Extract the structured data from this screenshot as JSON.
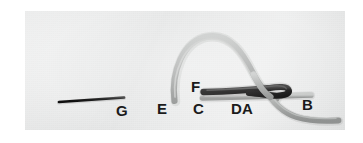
{
  "figure": {
    "kind": "photograph",
    "background_color": "#e9eaea",
    "page_background": "#ffffff",
    "photo_bounds": {
      "x": 25,
      "y": 11,
      "width": 320,
      "height": 119
    }
  },
  "colors": {
    "thread_gray": "#a6a8a7",
    "thread_gray_shadow": "#8c8e8d",
    "thread_gray_highlight": "#c9cbca",
    "thread_black": "#151515",
    "label_text": "#1b1b1b",
    "photo_background": "#e9eaea"
  },
  "labels": [
    {
      "id": "G",
      "text": "G",
      "x": 91,
      "y": 99,
      "describes": "thin straight black suture strand, detached, at far left"
    },
    {
      "id": "E",
      "text": "E",
      "x": 158,
      "y": 97,
      "describes": "free lower end of the large gray suture loop"
    },
    {
      "id": "F",
      "text": "F",
      "x": 191,
      "y": 77,
      "describes": "left end of the black suture strand"
    },
    {
      "id": "C",
      "text": "C",
      "x": 193,
      "y": 97,
      "describes": "left end of the lower gray suture strand"
    },
    {
      "id": "DA",
      "text": "DA",
      "x": 231,
      "y": 97,
      "describes": "crossing point where the strands meet"
    },
    {
      "id": "B",
      "text": "B",
      "x": 302,
      "y": 94,
      "describes": "blunt right end of the upper gray suture strand"
    }
  ],
  "elements": [
    {
      "name": "black-straight-strand-g",
      "color": "#151515",
      "description": "thin straight black line angled slightly upward to the right, isolated on the left side"
    },
    {
      "name": "gray-arch-loop",
      "color": "#a6a8a7",
      "description": "large inverted-U gray suture arc rising from lower-left end E, over the top, and descending to the right past the knot"
    },
    {
      "name": "black-hook-strand",
      "color": "#151515",
      "description": "thick black suture running horizontally from F to the right, then curving back on itself into a narrow hook/loop at the crossing"
    },
    {
      "name": "gray-horizontal-strand",
      "color": "#a6a8a7",
      "description": "gray suture running horizontally from C to the right, ending bluntly at B"
    },
    {
      "name": "gray-descending-tail",
      "color": "#a6a8a7",
      "description": "gray suture tail sweeping down and to the right toward the lower right corner"
    }
  ]
}
